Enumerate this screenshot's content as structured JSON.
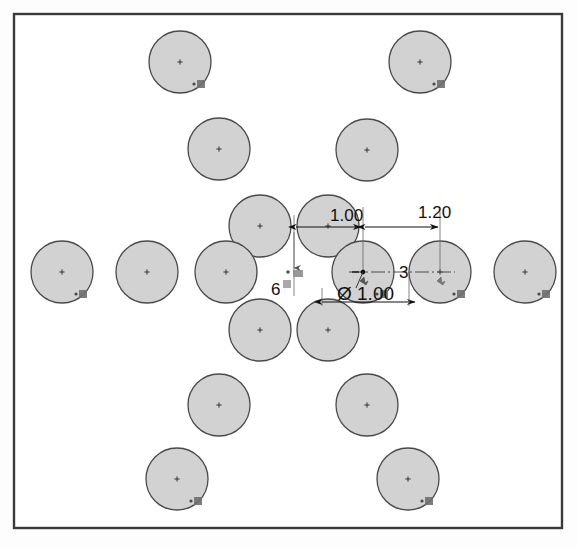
{
  "drawing": {
    "title": "Circular Pattern Sketch",
    "frame": {
      "x": 14,
      "y": 14,
      "width": 548,
      "height": 514,
      "stroke": "#3a3a3a",
      "fill": "#ffffff"
    },
    "circle_style": {
      "fill": "#d2d2d2",
      "stroke": "#4a4a4a",
      "radius": 31
    },
    "center_mark_color": "#333333",
    "constraint_marker_label": "concentric-constraint",
    "circles": [
      {
        "id": "c1",
        "cx": 180,
        "cy": 62,
        "r": 31,
        "marker": true
      },
      {
        "id": "c2",
        "cx": 420,
        "cy": 62,
        "r": 31,
        "marker": true
      },
      {
        "id": "c3",
        "cx": 219,
        "cy": 149,
        "r": 31,
        "marker": false
      },
      {
        "id": "c4",
        "cx": 367,
        "cy": 150,
        "r": 31,
        "marker": false
      },
      {
        "id": "c5",
        "cx": 260,
        "cy": 226,
        "r": 31,
        "marker": false
      },
      {
        "id": "c6",
        "cx": 328,
        "cy": 226,
        "r": 31,
        "marker": false
      },
      {
        "id": "c7",
        "cx": 62,
        "cy": 272,
        "r": 31,
        "marker": true
      },
      {
        "id": "c8",
        "cx": 147,
        "cy": 272,
        "r": 31,
        "marker": false
      },
      {
        "id": "c9",
        "cx": 226,
        "cy": 272,
        "r": 31,
        "marker": false
      },
      {
        "id": "c10",
        "cx": 363,
        "cy": 272,
        "r": 31,
        "marker": true
      },
      {
        "id": "c11",
        "cx": 440,
        "cy": 272,
        "r": 31,
        "marker": true
      },
      {
        "id": "c12",
        "cx": 525,
        "cy": 272,
        "r": 31,
        "marker": true
      },
      {
        "id": "c13",
        "cx": 260,
        "cy": 330,
        "r": 31,
        "marker": false
      },
      {
        "id": "c14",
        "cx": 328,
        "cy": 330,
        "r": 31,
        "marker": false
      },
      {
        "id": "c15",
        "cx": 219,
        "cy": 405,
        "r": 31,
        "marker": false
      },
      {
        "id": "c16",
        "cx": 367,
        "cy": 405,
        "r": 31,
        "marker": false
      },
      {
        "id": "c17",
        "cx": 177,
        "cy": 479,
        "r": 31,
        "marker": true
      },
      {
        "id": "c18",
        "cx": 408,
        "cy": 479,
        "r": 31,
        "marker": true
      }
    ],
    "dimensions": [
      {
        "id": "dim-spacing-horizontal",
        "name": "linear-dimension-1.00",
        "value": "1.00",
        "text_x": 330,
        "text_y": 221,
        "line_y": 227,
        "x1": 294,
        "x2": 363,
        "type": "linear"
      },
      {
        "id": "dim-pattern-radius",
        "name": "linear-dimension-1.20",
        "value": "1.20",
        "text_x": 418,
        "text_y": 218,
        "line_y": 227,
        "x1": 363,
        "x2": 440,
        "type": "linear"
      },
      {
        "id": "dim-hole-diameter",
        "name": "diameter-dimension",
        "value": "Ø 1.00",
        "text_x": 337,
        "text_y": 300,
        "type": "diameter",
        "leader_from_x": 363,
        "leader_from_y": 272
      },
      {
        "id": "dim-instance-count-radial",
        "name": "pattern-instance-count-3",
        "value": "3",
        "text_x": 399,
        "text_y": 278,
        "type": "count"
      },
      {
        "id": "dim-instance-count-angular",
        "name": "pattern-instance-count-6",
        "value": "6",
        "text_x": 271,
        "text_y": 295,
        "type": "count"
      }
    ],
    "axis_line": {
      "name": "centerline-horizontal",
      "x1": 349,
      "y1": 272,
      "x2": 455,
      "y2": 272,
      "color": "#4a4a4a"
    },
    "origin_point": {
      "x": 363,
      "y": 272,
      "label": "sketch-origin"
    }
  }
}
